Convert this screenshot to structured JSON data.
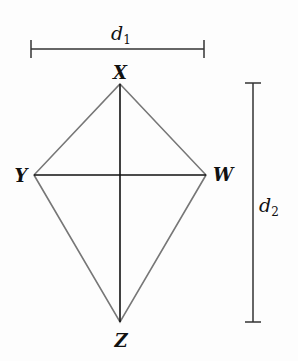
{
  "diagram": {
    "colors": {
      "background": "#fdfdfd",
      "kite_edges": "#777777",
      "diagonals": "#111111",
      "brackets": "#333333",
      "text": "#111111"
    },
    "vertices": [
      {
        "name": "X",
        "x": 120,
        "y": 84
      },
      {
        "name": "W",
        "x": 206,
        "y": 175
      },
      {
        "name": "Z",
        "x": 120,
        "y": 322
      },
      {
        "name": "Y",
        "x": 34,
        "y": 175
      }
    ],
    "labels": {
      "X": "X",
      "W": "W",
      "Z": "Z",
      "Y": "Y"
    },
    "measurements": {
      "d1": {
        "letter": "d",
        "subscript": "1",
        "from_x": 31,
        "to_x": 204,
        "y": 49
      },
      "d2": {
        "letter": "d",
        "subscript": "2",
        "from_y": 83,
        "to_y": 322,
        "x": 253
      }
    }
  }
}
